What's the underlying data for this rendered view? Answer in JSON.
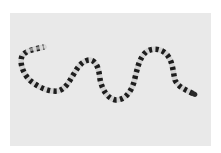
{
  "image": {
    "subject": "banded snake",
    "background_color": "#e9e9e9",
    "border_color": "#ffffff",
    "body_light_color": "#d8d8d8",
    "band_color": "#1e1e1e",
    "alt": "A black-and-white banded snake lying in an S-curve on a light gray background"
  }
}
